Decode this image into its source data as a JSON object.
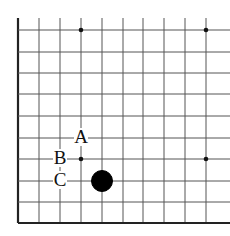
{
  "diagram": {
    "type": "go-board-corner",
    "edges": [
      "left",
      "bottom"
    ],
    "columns_x": [
      18,
      39,
      60,
      81,
      102,
      123,
      143,
      164,
      185,
      206
    ],
    "rows_y": [
      30,
      52,
      73,
      94,
      116,
      138,
      159,
      181,
      202,
      223
    ],
    "star_points": [
      [
        81,
        30
      ],
      [
        206,
        30
      ],
      [
        81,
        159
      ],
      [
        206,
        159
      ]
    ],
    "stones": [
      {
        "color": "black",
        "x": 102,
        "y": 181
      }
    ],
    "labels": [
      {
        "text": "A",
        "x": 81,
        "y": 138
      },
      {
        "text": "B",
        "x": 60,
        "y": 159
      },
      {
        "text": "C",
        "x": 60,
        "y": 181
      }
    ]
  }
}
